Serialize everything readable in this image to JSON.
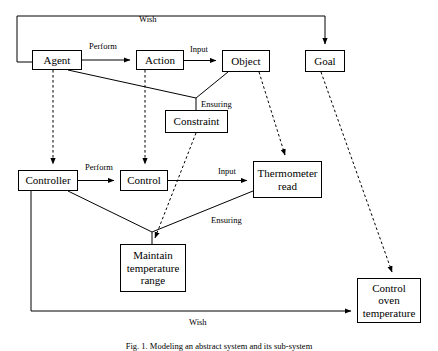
{
  "figure": {
    "caption": "Fig. 1.  Modeling an abstract system and its sub-system"
  },
  "colors": {
    "stroke": "#000000",
    "background": "#ffffff",
    "text": "#000000"
  },
  "nodes": [
    {
      "id": "agent",
      "label": "Agent",
      "x": 32,
      "y": 50,
      "w": 50,
      "h": 20
    },
    {
      "id": "action",
      "label": "Action",
      "x": 136,
      "y": 50,
      "w": 48,
      "h": 20
    },
    {
      "id": "object",
      "label": "Object",
      "x": 222,
      "y": 50,
      "w": 48,
      "h": 22
    },
    {
      "id": "goal",
      "label": "Goal",
      "x": 305,
      "y": 50,
      "w": 40,
      "h": 22
    },
    {
      "id": "constraint",
      "label": "Constraint",
      "x": 165,
      "y": 110,
      "w": 63,
      "h": 23
    },
    {
      "id": "controller",
      "label": "Controller",
      "x": 18,
      "y": 170,
      "w": 60,
      "h": 21
    },
    {
      "id": "control",
      "label": "Control",
      "x": 120,
      "y": 170,
      "w": 48,
      "h": 21
    },
    {
      "id": "thermometer",
      "label": "Thermometer\nread",
      "x": 253,
      "y": 161,
      "w": 69,
      "h": 37
    },
    {
      "id": "maintain",
      "label": "Maintain\ntemperature\nrange",
      "x": 120,
      "y": 244,
      "w": 66,
      "h": 48
    },
    {
      "id": "oven",
      "label": "Control\noven\ntemperature",
      "x": 357,
      "y": 278,
      "w": 64,
      "h": 45
    }
  ],
  "edge_labels": [
    {
      "id": "wish-top",
      "text": "Wish",
      "x": 139,
      "y": 14
    },
    {
      "id": "perform-top",
      "text": "Perform",
      "x": 89,
      "y": 41
    },
    {
      "id": "input-top",
      "text": "Input",
      "x": 190,
      "y": 44
    },
    {
      "id": "ensuring-top",
      "text": "Ensuring",
      "x": 201,
      "y": 99
    },
    {
      "id": "perform-bottom",
      "text": "Perform",
      "x": 85,
      "y": 162
    },
    {
      "id": "input-bottom",
      "text": "Input",
      "x": 218,
      "y": 166
    },
    {
      "id": "ensuring-bottom",
      "text": "Ensuring",
      "x": 211,
      "y": 215
    },
    {
      "id": "wish-bottom",
      "text": "Wish",
      "x": 189,
      "y": 317
    }
  ],
  "connectors": [
    {
      "id": "wish-agent-to-goal",
      "style": "solid",
      "kind": "orthogonal",
      "label": "Wish",
      "from": "agent",
      "to": "goal"
    },
    {
      "id": "perform-agent-to-action",
      "style": "solid",
      "kind": "straight",
      "label": "Perform",
      "from": "agent",
      "to": "action"
    },
    {
      "id": "input-action-to-object",
      "style": "solid",
      "kind": "straight",
      "label": "Input",
      "from": "action",
      "to": "object"
    },
    {
      "id": "ensuring-to-constraint",
      "style": "solid",
      "kind": "vee",
      "label": "Ensuring",
      "from": "agent+object",
      "to": "constraint"
    },
    {
      "id": "agent-to-controller",
      "style": "dashed",
      "kind": "straight",
      "label": "",
      "from": "agent",
      "to": "controller"
    },
    {
      "id": "action-to-control",
      "style": "dashed",
      "kind": "straight",
      "label": "",
      "from": "action",
      "to": "control"
    },
    {
      "id": "object-to-thermometer",
      "style": "dashed",
      "kind": "straight",
      "label": "",
      "from": "object",
      "to": "thermometer"
    },
    {
      "id": "goal-to-oven",
      "style": "dashed",
      "kind": "straight",
      "label": "",
      "from": "goal",
      "to": "oven"
    },
    {
      "id": "constraint-to-maintain",
      "style": "dashed",
      "kind": "straight",
      "label": "",
      "from": "constraint",
      "to": "maintain"
    },
    {
      "id": "perform-controller-control",
      "style": "solid",
      "kind": "straight",
      "label": "Perform",
      "from": "controller",
      "to": "control"
    },
    {
      "id": "input-control-thermometer",
      "style": "solid",
      "kind": "straight",
      "label": "Input",
      "from": "control",
      "to": "thermometer"
    },
    {
      "id": "ensuring-to-maintain",
      "style": "solid",
      "kind": "vee",
      "label": "Ensuring",
      "from": "controller+thermometer",
      "to": "maintain"
    },
    {
      "id": "wish-controller-to-oven",
      "style": "solid",
      "kind": "orthogonal",
      "label": "Wish",
      "from": "controller",
      "to": "oven"
    }
  ]
}
